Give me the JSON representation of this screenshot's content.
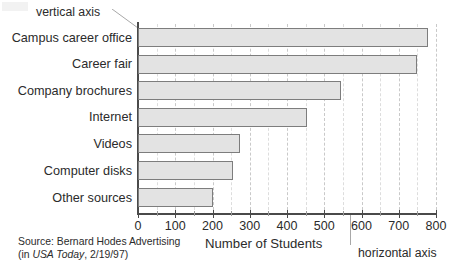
{
  "chart_data": {
    "type": "bar",
    "orientation": "horizontal",
    "title": "",
    "xlabel": "Number of Students",
    "ylabel": "",
    "xlim": [
      0,
      800
    ],
    "xticks": [
      0,
      100,
      200,
      300,
      400,
      500,
      600,
      700,
      800
    ],
    "xticklabels": [
      "0",
      "100",
      "200",
      "300",
      "400",
      "500",
      "600",
      "700",
      "800"
    ],
    "grid": "vertical-dashed",
    "legend": "none",
    "categories": [
      "Campus career office",
      "Career fair",
      "Company brochures",
      "Internet",
      "Videos",
      "Computer disks",
      "Other sources"
    ],
    "values": [
      778,
      750,
      545,
      455,
      275,
      255,
      202
    ],
    "series": [
      {
        "name": "Number of Students",
        "values": [
          778,
          750,
          545,
          455,
          275,
          255,
          202
        ]
      }
    ],
    "annotations": [
      {
        "text": "vertical axis",
        "target": "y-axis"
      },
      {
        "text": "horizontal axis",
        "target": "x-axis"
      }
    ],
    "colors": {
      "bar_fill": "#e3e3e3",
      "bar_stroke": "#7d7d7d",
      "axis": "#4a4a4a",
      "grid": "#c9c9c9",
      "text": "#2b2b2b"
    }
  },
  "annotations": {
    "vertical_axis": "vertical axis",
    "horizontal_axis": "horizontal axis"
  },
  "axis": {
    "x_title": "Number of Students"
  },
  "source": {
    "line1": "Source: Bernard Hodes Advertising",
    "line2_prefix": "(in ",
    "line2_italic": "USA Today",
    "line2_suffix": ", 2/19/97)"
  }
}
